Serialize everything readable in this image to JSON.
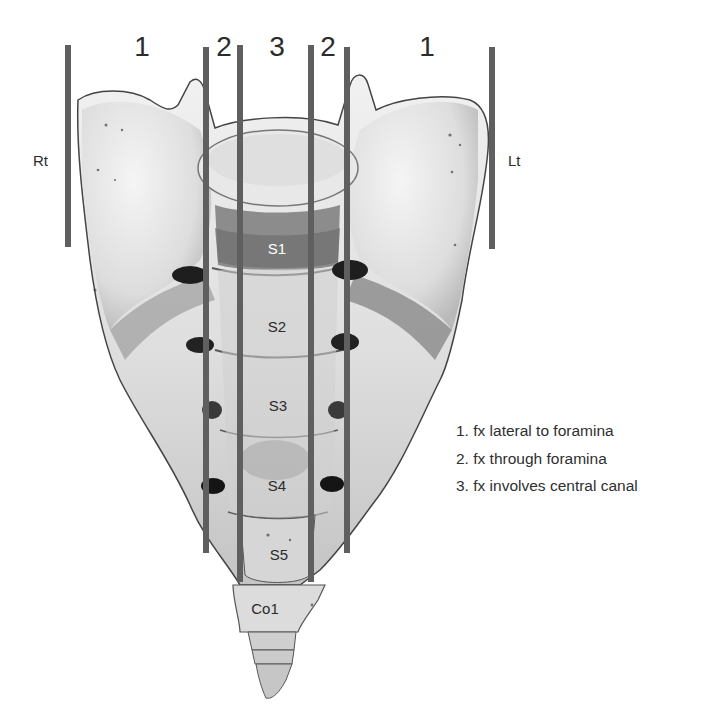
{
  "figure": {
    "zone_labels": [
      {
        "text": "1",
        "x": 142
      },
      {
        "text": "2",
        "x": 224
      },
      {
        "text": "3",
        "x": 277
      },
      {
        "text": "2",
        "x": 328
      },
      {
        "text": "1",
        "x": 427
      }
    ],
    "side_labels": {
      "right": "Rt",
      "left": "Lt"
    },
    "segments": [
      {
        "name": "S1",
        "x": 277,
        "y": 248,
        "tone": "light"
      },
      {
        "name": "S2",
        "x": 277,
        "y": 326,
        "tone": "dark"
      },
      {
        "name": "S3",
        "x": 278,
        "y": 405,
        "tone": "dark"
      },
      {
        "name": "S4",
        "x": 277,
        "y": 485,
        "tone": "dark"
      },
      {
        "name": "S5",
        "x": 279,
        "y": 554,
        "tone": "dark"
      },
      {
        "name": "Co1",
        "x": 265,
        "y": 608,
        "tone": "dark"
      }
    ],
    "lines": [
      {
        "x": 68,
        "top": 45,
        "bottom": 247
      },
      {
        "x": 206,
        "top": 47,
        "bottom": 553
      },
      {
        "x": 240,
        "top": 45,
        "bottom": 582
      },
      {
        "x": 311,
        "top": 45,
        "bottom": 582
      },
      {
        "x": 347,
        "top": 47,
        "bottom": 553
      },
      {
        "x": 492,
        "top": 47,
        "bottom": 249
      }
    ],
    "legend": [
      "1. fx lateral to foramina",
      "2. fx through foramina",
      "3. fx involves central canal"
    ],
    "colors": {
      "line": "#5f5f5f",
      "bone_light": "#ececec",
      "bone_mid": "#c9c9c9",
      "bone_dark": "#7a7a7a",
      "shadow": "#2a2a2a"
    }
  }
}
